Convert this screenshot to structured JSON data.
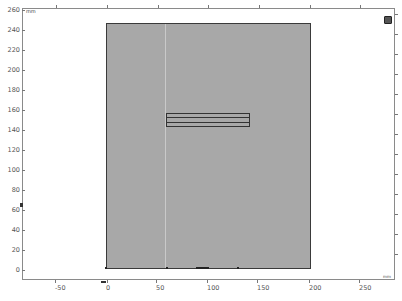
{
  "view": {
    "units_top": "mm",
    "units_bottom": "mm",
    "colors": {
      "domain_fill": "#a8a8a8",
      "domain_edge": "#3a3a3a",
      "axis": "#8a8a8a",
      "background": "#ffffff"
    }
  },
  "axes": {
    "y_ticks": [
      "260",
      "240",
      "220",
      "200",
      "180",
      "160",
      "140",
      "120",
      "100",
      "80",
      "60",
      "40",
      "20",
      "0"
    ],
    "x_ticks": [
      "-50",
      "0",
      "50",
      "100",
      "150",
      "200",
      "250"
    ]
  },
  "geometry": {
    "outer_rectangle": {
      "x": [
        0,
        200
      ],
      "y": [
        0,
        250
      ],
      "unit": "mm"
    },
    "inner_rectangle": {
      "x": [
        58,
        137
      ],
      "y": [
        144,
        157
      ],
      "unit": "mm"
    }
  },
  "controls": {
    "corner_button": "view-toggle-icon"
  }
}
